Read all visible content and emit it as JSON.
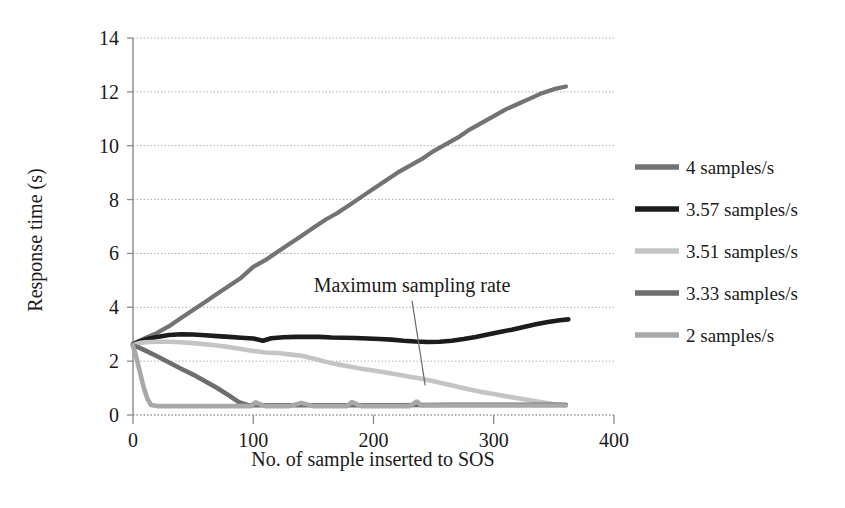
{
  "chart_data": {
    "type": "line",
    "title": "",
    "xlabel": "No. of sample inserted to SOS",
    "ylabel": "Response time (s)",
    "xlim": [
      0,
      400
    ],
    "ylim": [
      0,
      14
    ],
    "xticks": [
      "0",
      "100",
      "200",
      "300",
      "400"
    ],
    "xtick_values": [
      0,
      100,
      200,
      300,
      400
    ],
    "yticks": [
      "0",
      "2",
      "4",
      "6",
      "8",
      "10",
      "12",
      "14"
    ],
    "ytick_values": [
      0,
      2,
      4,
      6,
      8,
      10,
      12,
      14
    ],
    "grid": true,
    "grid_axis": "y",
    "legend_position": "right",
    "annotations": [
      {
        "text": "Maximum sampling rate",
        "text_x": 232,
        "text_y": 4.55,
        "leader_from_x": 232,
        "leader_from_y": 4.25,
        "leader_to_x": 243,
        "leader_to_y": 1.1
      }
    ],
    "series": [
      {
        "name": "4 samples/s",
        "color": "#737373",
        "width": 4.2,
        "x": [
          0,
          5,
          10,
          20,
          30,
          40,
          50,
          60,
          70,
          80,
          90,
          100,
          110,
          120,
          130,
          140,
          150,
          160,
          170,
          180,
          190,
          200,
          210,
          220,
          230,
          240,
          250,
          260,
          270,
          280,
          290,
          300,
          310,
          320,
          330,
          340,
          350,
          360
        ],
        "y": [
          2.65,
          2.75,
          2.85,
          3.05,
          3.3,
          3.6,
          3.9,
          4.2,
          4.5,
          4.8,
          5.1,
          5.5,
          5.75,
          6.05,
          6.35,
          6.65,
          6.95,
          7.25,
          7.5,
          7.8,
          8.1,
          8.4,
          8.7,
          9.0,
          9.25,
          9.5,
          9.8,
          10.05,
          10.3,
          10.6,
          10.85,
          11.1,
          11.35,
          11.55,
          11.75,
          11.95,
          12.1,
          12.2
        ]
      },
      {
        "name": "3.57 samples/s",
        "color": "#1c1c1c",
        "width": 4.6,
        "x": [
          0,
          5,
          10,
          20,
          30,
          40,
          50,
          60,
          70,
          80,
          90,
          100,
          108,
          115,
          125,
          135,
          145,
          155,
          165,
          175,
          185,
          195,
          205,
          215,
          225,
          235,
          245,
          255,
          265,
          275,
          285,
          295,
          305,
          315,
          325,
          335,
          345,
          355,
          362
        ],
        "y": [
          2.62,
          2.72,
          2.8,
          2.9,
          2.97,
          3.0,
          2.99,
          2.96,
          2.93,
          2.9,
          2.87,
          2.84,
          2.76,
          2.85,
          2.89,
          2.9,
          2.9,
          2.9,
          2.88,
          2.87,
          2.86,
          2.84,
          2.82,
          2.8,
          2.76,
          2.73,
          2.71,
          2.72,
          2.76,
          2.82,
          2.9,
          2.99,
          3.08,
          3.17,
          3.27,
          3.37,
          3.45,
          3.52,
          3.55
        ]
      },
      {
        "name": "3.51 samples/s",
        "color": "#c4c4c4",
        "width": 4.6,
        "x": [
          0,
          5,
          10,
          20,
          30,
          40,
          50,
          60,
          70,
          80,
          90,
          100,
          110,
          120,
          130,
          140,
          150,
          160,
          170,
          180,
          190,
          200,
          210,
          220,
          230,
          240,
          250,
          260,
          270,
          280,
          290,
          300,
          310,
          320,
          330,
          340,
          350,
          358
        ],
        "y": [
          2.6,
          2.67,
          2.7,
          2.72,
          2.72,
          2.7,
          2.67,
          2.63,
          2.58,
          2.52,
          2.45,
          2.38,
          2.32,
          2.3,
          2.25,
          2.2,
          2.1,
          1.98,
          1.88,
          1.8,
          1.72,
          1.65,
          1.58,
          1.5,
          1.42,
          1.35,
          1.25,
          1.15,
          1.05,
          0.95,
          0.85,
          0.78,
          0.7,
          0.62,
          0.55,
          0.47,
          0.4,
          0.36
        ]
      },
      {
        "name": "3.33 samples/s",
        "color": "#6e6e6e",
        "width": 4.6,
        "x": [
          0,
          5,
          10,
          20,
          30,
          40,
          50,
          60,
          70,
          80,
          88,
          95,
          100,
          120,
          140,
          160,
          180,
          200,
          220,
          240,
          260,
          280,
          300,
          320,
          340,
          360
        ],
        "y": [
          2.58,
          2.5,
          2.4,
          2.18,
          1.95,
          1.72,
          1.5,
          1.25,
          1.0,
          0.72,
          0.48,
          0.37,
          0.36,
          0.36,
          0.36,
          0.36,
          0.36,
          0.36,
          0.36,
          0.37,
          0.38,
          0.38,
          0.38,
          0.38,
          0.38,
          0.38
        ]
      },
      {
        "name": "2 samples/s",
        "color": "#a8a8a8",
        "width": 4.6,
        "x": [
          0,
          3,
          6,
          9,
          12,
          15,
          20,
          30,
          40,
          50,
          60,
          70,
          80,
          90,
          98,
          102,
          110,
          120,
          130,
          140,
          150,
          160,
          170,
          178,
          182,
          190,
          200,
          210,
          220,
          230,
          236,
          240,
          250,
          260,
          270,
          280,
          290,
          300,
          310,
          320,
          330,
          340,
          350,
          360
        ],
        "y": [
          2.58,
          2.1,
          1.55,
          1.0,
          0.6,
          0.37,
          0.33,
          0.33,
          0.33,
          0.33,
          0.33,
          0.33,
          0.33,
          0.33,
          0.33,
          0.47,
          0.33,
          0.33,
          0.33,
          0.45,
          0.33,
          0.33,
          0.33,
          0.33,
          0.48,
          0.33,
          0.33,
          0.33,
          0.33,
          0.33,
          0.5,
          0.35,
          0.35,
          0.35,
          0.35,
          0.35,
          0.35,
          0.35,
          0.35,
          0.35,
          0.35,
          0.35,
          0.35,
          0.35
        ]
      }
    ]
  },
  "legend": {
    "items": [
      {
        "label": "4 samples/s",
        "color": "#737373"
      },
      {
        "label": "3.57 samples/s",
        "color": "#1c1c1c"
      },
      {
        "label": "3.51 samples/s",
        "color": "#c4c4c4"
      },
      {
        "label": "3.33 samples/s",
        "color": "#6e6e6e"
      },
      {
        "label": "2 samples/s",
        "color": "#a8a8a8"
      }
    ]
  },
  "axes": {
    "x_title": "No. of sample inserted to SOS",
    "y_title": "Response time (s)",
    "x_ticks": [
      "0",
      "100",
      "200",
      "300",
      "400"
    ],
    "y_ticks": [
      "14",
      "12",
      "10",
      "8",
      "6",
      "4",
      "2",
      "0"
    ]
  },
  "annotation": {
    "text": "Maximum sampling rate"
  },
  "colors": {
    "axis": "#8a8a8a",
    "grid": "#b0b0b0",
    "text": "#1a1a1a",
    "background": "#ffffff"
  }
}
